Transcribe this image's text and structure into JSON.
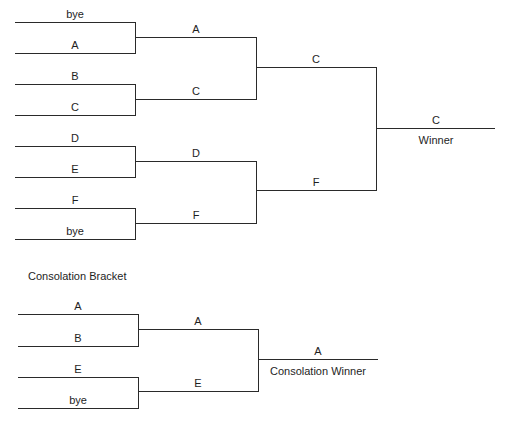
{
  "main_bracket": {
    "round1": [
      {
        "label": "bye"
      },
      {
        "label": "A"
      },
      {
        "label": "B"
      },
      {
        "label": "C"
      },
      {
        "label": "D"
      },
      {
        "label": "E"
      },
      {
        "label": "F"
      },
      {
        "label": "bye"
      }
    ],
    "round2": [
      {
        "label": "A"
      },
      {
        "label": "C"
      },
      {
        "label": "D"
      },
      {
        "label": "F"
      }
    ],
    "round3": [
      {
        "label": "C"
      },
      {
        "label": "F"
      }
    ],
    "final": {
      "label": "C",
      "caption": "Winner"
    }
  },
  "consolation_bracket": {
    "title": "Consolation Bracket",
    "round1": [
      {
        "label": "A"
      },
      {
        "label": "B"
      },
      {
        "label": "E"
      },
      {
        "label": "bye"
      }
    ],
    "round2": [
      {
        "label": "A"
      },
      {
        "label": "E"
      }
    ],
    "final": {
      "label": "A",
      "caption": "Consolation Winner"
    }
  },
  "colors": {
    "line": "#2a2a2a",
    "text": "#1e1e1e",
    "background": "#ffffff"
  }
}
